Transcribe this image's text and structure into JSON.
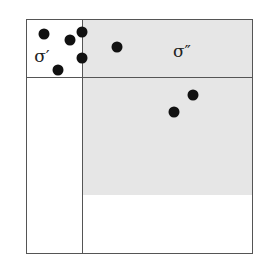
{
  "diagram": {
    "labels": {
      "sigma_prime": "σ′",
      "sigma_double_prime": "σ″"
    },
    "regions": [
      {
        "name": "sigma-prime-region",
        "shaded": false
      },
      {
        "name": "sigma-double-prime-region",
        "shaded": true
      },
      {
        "name": "lower-right-shaded-region",
        "shaded": true
      },
      {
        "name": "lower-left-region",
        "shaded": false
      },
      {
        "name": "bottom-right-unshaded-region",
        "shaded": false
      }
    ],
    "points": [
      {
        "x": 44,
        "y": 34
      },
      {
        "x": 70,
        "y": 40
      },
      {
        "x": 82,
        "y": 32
      },
      {
        "x": 82,
        "y": 58
      },
      {
        "x": 58,
        "y": 70
      },
      {
        "x": 117,
        "y": 47
      },
      {
        "x": 193,
        "y": 95
      },
      {
        "x": 174,
        "y": 112
      }
    ],
    "colors": {
      "shade": "#e6e6e6",
      "line": "#555555",
      "dot": "#111111"
    }
  }
}
